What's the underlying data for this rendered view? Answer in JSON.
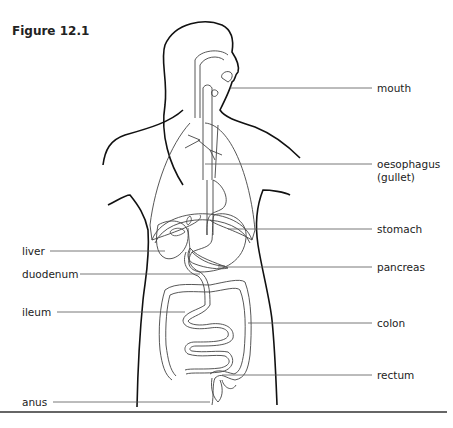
{
  "figure": {
    "title": "Figure 12.1",
    "labels_right": [
      {
        "id": "mouth",
        "text": "mouth"
      },
      {
        "id": "oesophagus",
        "text": "oesophagus",
        "text2": "(gullet)"
      },
      {
        "id": "stomach",
        "text": "stomach"
      },
      {
        "id": "pancreas",
        "text": "pancreas"
      },
      {
        "id": "colon",
        "text": "colon"
      },
      {
        "id": "rectum",
        "text": "rectum"
      }
    ],
    "labels_left": [
      {
        "id": "liver",
        "text": "liver"
      },
      {
        "id": "duodenum",
        "text": "duodenum"
      },
      {
        "id": "ileum",
        "text": "ileum"
      },
      {
        "id": "anus",
        "text": "anus"
      }
    ]
  }
}
